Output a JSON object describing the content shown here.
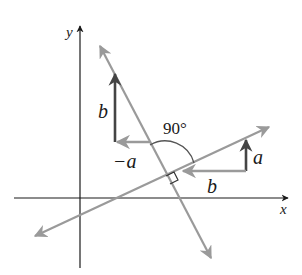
{
  "diagram": {
    "axes": {
      "x_label": "x",
      "y_label": "y"
    },
    "labels": {
      "b_vertical": "b",
      "neg_a": "−a",
      "angle": "90°",
      "a_vertical": "a",
      "b_horizontal": "b"
    },
    "colors": {
      "axis": "#1a1a1a",
      "line": "#9a9a9a",
      "vector_dark": "#444444",
      "vector_light": "#9a9a9a",
      "arc": "#555555"
    }
  }
}
